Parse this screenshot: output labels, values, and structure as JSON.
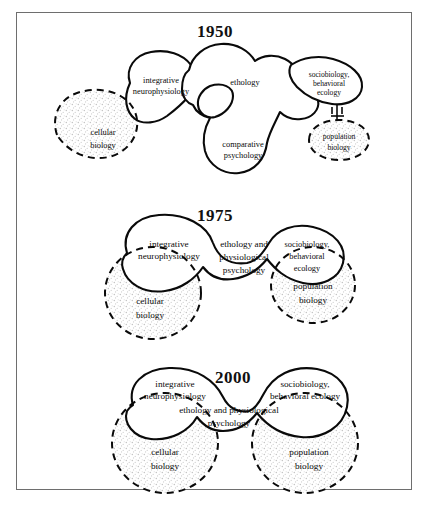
{
  "figure": {
    "type": "conceptual-venn-diagram",
    "border_color": "#6e6e6e",
    "outline_color": "#0a0a0a",
    "stipple_color": "#bdbdbd"
  },
  "panels": [
    {
      "year": "1950",
      "solid_regions": [
        {
          "id": "integrative-neurophysiology",
          "lines": [
            "integrative",
            "neurophysiology"
          ]
        },
        {
          "id": "ethology",
          "lines": [
            "ethology"
          ]
        },
        {
          "id": "comparative-psychology",
          "lines": [
            "comparative",
            "psychology"
          ]
        },
        {
          "id": "sociobiology-behavioral-ecology",
          "lines": [
            "sociobiology,",
            "behavioral",
            "ecology"
          ]
        }
      ],
      "dashed_regions": [
        {
          "id": "cellular-biology",
          "lines": [
            "cellular",
            "biology"
          ]
        },
        {
          "id": "population-biology",
          "lines": [
            "population",
            "biology"
          ]
        }
      ],
      "connectors": [
        {
          "from": "sociobiology-behavioral-ecology",
          "to": "population-biology"
        }
      ]
    },
    {
      "year": "1975",
      "solid_regions": [
        {
          "id": "integrative-neurophysiology",
          "lines": [
            "integrative",
            "neurophysiology"
          ]
        },
        {
          "id": "ethology-and-physiological-psychology",
          "lines": [
            "ethology and",
            "physiological",
            "psychology"
          ]
        },
        {
          "id": "sociobiology-behavioral-ecology",
          "lines": [
            "sociobiology,",
            "behavioral",
            "ecology"
          ]
        }
      ],
      "dashed_regions": [
        {
          "id": "cellular-biology",
          "lines": [
            "cellular",
            "biology"
          ]
        },
        {
          "id": "population-biology",
          "lines": [
            "population",
            "biology"
          ]
        }
      ],
      "connectors": []
    },
    {
      "year": "2000",
      "solid_regions": [
        {
          "id": "integrative-neurophysiology",
          "lines": [
            "integrative",
            "neurophysiology"
          ]
        },
        {
          "id": "ethology-and-physiological-psychology",
          "lines": [
            "ethology and physiological",
            "psychology"
          ]
        },
        {
          "id": "sociobiology-behavioral-ecology",
          "lines": [
            "sociobiology,",
            "behavioral ecology"
          ]
        }
      ],
      "dashed_regions": [
        {
          "id": "cellular-biology",
          "lines": [
            "cellular",
            "biology"
          ]
        },
        {
          "id": "population-biology",
          "lines": [
            "population",
            "biology"
          ]
        }
      ],
      "connectors": []
    }
  ]
}
